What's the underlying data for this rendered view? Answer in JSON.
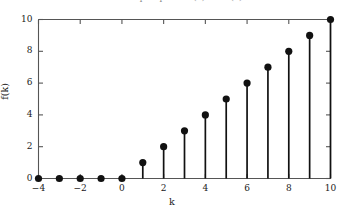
{
  "chart_data": {
    "type": "scatter",
    "plot_style": "stem",
    "title": "Unit ramp sequence f(k) = k u(k)",
    "xlabel": "k",
    "ylabel": "f(k)",
    "x": [
      -4,
      -3,
      -2,
      -1,
      0,
      1,
      2,
      3,
      4,
      5,
      6,
      7,
      8,
      9,
      10
    ],
    "values": [
      0,
      0,
      0,
      0,
      0,
      1,
      2,
      3,
      4,
      5,
      6,
      7,
      8,
      9,
      10
    ],
    "xlim": [
      -4,
      10
    ],
    "ylim": [
      0,
      10
    ],
    "xticks": [
      -4,
      -2,
      0,
      2,
      4,
      6,
      8,
      10
    ],
    "xtick_labels": [
      "−4",
      "−2",
      "0",
      "2",
      "4",
      "6",
      "8",
      "10"
    ],
    "yticks": [
      0,
      2,
      4,
      6,
      8,
      10
    ],
    "ytick_labels": [
      "0",
      "2",
      "4",
      "6",
      "8",
      "10"
    ],
    "grid": false,
    "legend": null,
    "marker": "filled-circle",
    "marker_color": "#111111",
    "stem_color": "#111111",
    "axis_color": "#555555",
    "background_color": "#ffffff"
  }
}
